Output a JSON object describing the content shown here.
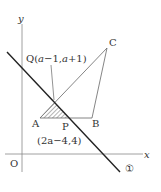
{
  "axes": {
    "x_label": "x",
    "y_label": "y",
    "origin_label": "O"
  },
  "points": {
    "A": {
      "label": "A"
    },
    "B": {
      "label": "B"
    },
    "C": {
      "label": "C"
    },
    "P": {
      "label": "P",
      "coords": "(2a−4,4)"
    },
    "Q": {
      "label": "Q",
      "coords_prefix": "Q(",
      "coords_a1": "a",
      "coords_mid": "−1,",
      "coords_a2": "a",
      "coords_suffix": "+1)"
    }
  },
  "line": {
    "label": "①"
  },
  "colors": {
    "line": "#222222",
    "thin": "#666666",
    "hatch": "#444444"
  }
}
